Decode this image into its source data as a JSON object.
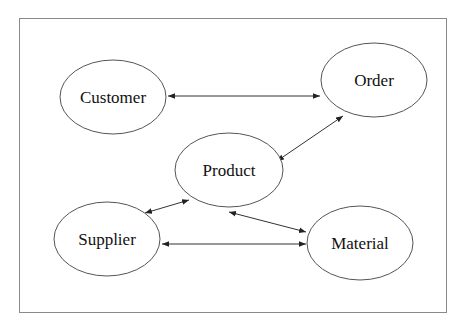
{
  "diagram": {
    "type": "entity-relationship",
    "frame": {
      "x": 19,
      "y": 18,
      "w": 428,
      "h": 295,
      "stroke": "#8a8a8a"
    },
    "nodes": [
      {
        "id": "customer",
        "label": "Customer",
        "cx": 113,
        "cy": 97,
        "rx": 53,
        "ry": 37
      },
      {
        "id": "order",
        "label": "Order",
        "cx": 374,
        "cy": 80,
        "rx": 53,
        "ry": 37
      },
      {
        "id": "product",
        "label": "Product",
        "cx": 229,
        "cy": 170,
        "rx": 54,
        "ry": 37
      },
      {
        "id": "supplier",
        "label": "Supplier",
        "cx": 107,
        "cy": 239,
        "rx": 53,
        "ry": 37
      },
      {
        "id": "material",
        "label": "Material",
        "cx": 360,
        "cy": 243,
        "rx": 53,
        "ry": 37
      }
    ],
    "edges": [
      {
        "from": "customer",
        "to": "order",
        "bidirectional": true,
        "x1": 168,
        "y1": 96,
        "x2": 320,
        "y2": 96
      },
      {
        "from": "order",
        "to": "product",
        "bidirectional": true,
        "x1": 343,
        "y1": 116,
        "x2": 277,
        "y2": 161
      },
      {
        "from": "supplier",
        "to": "product",
        "bidirectional": true,
        "x1": 145,
        "y1": 213,
        "x2": 189,
        "y2": 200
      },
      {
        "from": "supplier",
        "to": "material",
        "bidirectional": true,
        "x1": 162,
        "y1": 244,
        "x2": 306,
        "y2": 244
      },
      {
        "from": "product",
        "to": "material",
        "bidirectional": true,
        "x1": 229,
        "y1": 212,
        "x2": 306,
        "y2": 232
      }
    ],
    "colors": {
      "stroke": "#333333",
      "text": "#111111",
      "background": "#ffffff"
    }
  }
}
